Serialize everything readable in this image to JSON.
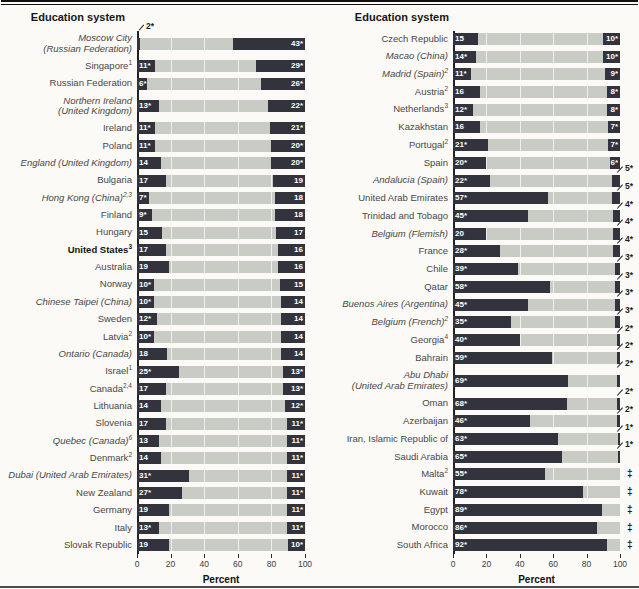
{
  "chart_data": {
    "type": "bar",
    "orientation": "horizontal",
    "header": "Education system",
    "xlabel": "Percent",
    "xlim": [
      0,
      100
    ],
    "xticks": [
      0,
      20,
      40,
      60,
      80,
      100
    ],
    "grid": "white vertical lines at 20/40/60/80 over bars",
    "legend_position": "none",
    "colors": {
      "segment_dark": "#32333c",
      "bar_background_gray": "#c8ccc5",
      "value_text": "#ffffff",
      "annotation_text": "#1c1c1c"
    },
    "panels": [
      {
        "rows": [
          {
            "lines": [
              "Moscow City",
              "(Russian Federation)"
            ],
            "italic": true,
            "left": {
              "v": 2,
              "t": "2*",
              "pos": "above"
            },
            "right": {
              "v": 43,
              "t": "43*",
              "pos": "in"
            }
          },
          {
            "lines": [
              "Singapore"
            ],
            "sup": "1",
            "left": {
              "v": 11,
              "t": "11*",
              "pos": "in"
            },
            "right": {
              "v": 29,
              "t": "29*",
              "pos": "in"
            }
          },
          {
            "lines": [
              "Russian Federation"
            ],
            "left": {
              "v": 6,
              "t": "6*",
              "pos": "in"
            },
            "right": {
              "v": 26,
              "t": "26*",
              "pos": "in"
            }
          },
          {
            "lines": [
              "Northern Ireland",
              "(United Kingdom)"
            ],
            "italic": true,
            "left": {
              "v": 13,
              "t": "13*",
              "pos": "in"
            },
            "right": {
              "v": 22,
              "t": "22*",
              "pos": "in"
            }
          },
          {
            "lines": [
              "Ireland"
            ],
            "left": {
              "v": 11,
              "t": "11*",
              "pos": "in"
            },
            "right": {
              "v": 21,
              "t": "21*",
              "pos": "in"
            }
          },
          {
            "lines": [
              "Poland"
            ],
            "left": {
              "v": 11,
              "t": "11*",
              "pos": "in"
            },
            "right": {
              "v": 20,
              "t": "20*",
              "pos": "in"
            }
          },
          {
            "lines": [
              "England (United Kingdom)"
            ],
            "italic": true,
            "left": {
              "v": 14,
              "t": "14",
              "pos": "in"
            },
            "right": {
              "v": 20,
              "t": "20*",
              "pos": "in"
            }
          },
          {
            "lines": [
              "Bulgaria"
            ],
            "left": {
              "v": 17,
              "t": "17",
              "pos": "in"
            },
            "right": {
              "v": 19,
              "t": "19",
              "pos": "in"
            }
          },
          {
            "lines": [
              "Hong Kong (China)"
            ],
            "sup": "2,3",
            "italic": true,
            "left": {
              "v": 7,
              "t": "7*",
              "pos": "in"
            },
            "right": {
              "v": 18,
              "t": "18",
              "pos": "in"
            }
          },
          {
            "lines": [
              "Finland"
            ],
            "left": {
              "v": 9,
              "t": "9*",
              "pos": "in"
            },
            "right": {
              "v": 18,
              "t": "18",
              "pos": "in"
            }
          },
          {
            "lines": [
              "Hungary"
            ],
            "left": {
              "v": 15,
              "t": "15",
              "pos": "in"
            },
            "right": {
              "v": 17,
              "t": "17",
              "pos": "in"
            }
          },
          {
            "lines": [
              "United States"
            ],
            "sup": "3",
            "bold": true,
            "left": {
              "v": 17,
              "t": "17",
              "pos": "in"
            },
            "right": {
              "v": 16,
              "t": "16",
              "pos": "in"
            }
          },
          {
            "lines": [
              "Australia"
            ],
            "left": {
              "v": 19,
              "t": "19",
              "pos": "in"
            },
            "right": {
              "v": 16,
              "t": "16",
              "pos": "in"
            }
          },
          {
            "lines": [
              "Norway"
            ],
            "left": {
              "v": 10,
              "t": "10*",
              "pos": "in"
            },
            "right": {
              "v": 15,
              "t": "15",
              "pos": "in"
            }
          },
          {
            "lines": [
              "Chinese Taipei (China)"
            ],
            "italic": true,
            "left": {
              "v": 10,
              "t": "10*",
              "pos": "in"
            },
            "right": {
              "v": 14,
              "t": "14",
              "pos": "in"
            }
          },
          {
            "lines": [
              "Sweden"
            ],
            "left": {
              "v": 12,
              "t": "12*",
              "pos": "in"
            },
            "right": {
              "v": 14,
              "t": "14",
              "pos": "in"
            }
          },
          {
            "lines": [
              "Latvia"
            ],
            "sup": "2",
            "left": {
              "v": 10,
              "t": "10*",
              "pos": "in"
            },
            "right": {
              "v": 14,
              "t": "14",
              "pos": "in"
            }
          },
          {
            "lines": [
              "Ontario (Canada)"
            ],
            "italic": true,
            "left": {
              "v": 18,
              "t": "18",
              "pos": "in"
            },
            "right": {
              "v": 14,
              "t": "14",
              "pos": "in"
            }
          },
          {
            "lines": [
              "Israel"
            ],
            "sup": "1",
            "left": {
              "v": 25,
              "t": "25*",
              "pos": "in"
            },
            "right": {
              "v": 13,
              "t": "13*",
              "pos": "in"
            }
          },
          {
            "lines": [
              "Canada"
            ],
            "sup": "2,4",
            "left": {
              "v": 17,
              "t": "17",
              "pos": "in"
            },
            "right": {
              "v": 13,
              "t": "13*",
              "pos": "in"
            }
          },
          {
            "lines": [
              "Lithuania"
            ],
            "left": {
              "v": 14,
              "t": "14",
              "pos": "in"
            },
            "right": {
              "v": 12,
              "t": "12*",
              "pos": "in"
            }
          },
          {
            "lines": [
              "Slovenia"
            ],
            "left": {
              "v": 17,
              "t": "17",
              "pos": "in"
            },
            "right": {
              "v": 11,
              "t": "11*",
              "pos": "in"
            }
          },
          {
            "lines": [
              "Quebec (Canada)"
            ],
            "sup": "6",
            "italic": true,
            "left": {
              "v": 13,
              "t": "13",
              "pos": "in"
            },
            "right": {
              "v": 11,
              "t": "11*",
              "pos": "in"
            }
          },
          {
            "lines": [
              "Denmark"
            ],
            "sup": "2",
            "left": {
              "v": 14,
              "t": "14",
              "pos": "in"
            },
            "right": {
              "v": 11,
              "t": "11*",
              "pos": "in"
            }
          },
          {
            "lines": [
              "Dubai (United Arab Emirates)"
            ],
            "italic": true,
            "left": {
              "v": 31,
              "t": "31*",
              "pos": "in"
            },
            "right": {
              "v": 11,
              "t": "11*",
              "pos": "in"
            }
          },
          {
            "lines": [
              "New Zealand"
            ],
            "left": {
              "v": 27,
              "t": "27*",
              "pos": "in"
            },
            "right": {
              "v": 11,
              "t": "11*",
              "pos": "in"
            }
          },
          {
            "lines": [
              "Germany"
            ],
            "left": {
              "v": 19,
              "t": "19",
              "pos": "in"
            },
            "right": {
              "v": 11,
              "t": "11*",
              "pos": "in"
            }
          },
          {
            "lines": [
              "Italy"
            ],
            "left": {
              "v": 13,
              "t": "13*",
              "pos": "in"
            },
            "right": {
              "v": 11,
              "t": "11*",
              "pos": "in"
            }
          },
          {
            "lines": [
              "Slovak Republic"
            ],
            "left": {
              "v": 19,
              "t": "19",
              "pos": "in"
            },
            "right": {
              "v": 10,
              "t": "10*",
              "pos": "in"
            }
          }
        ]
      },
      {
        "rows": [
          {
            "lines": [
              "Czech Republic"
            ],
            "left": {
              "v": 15,
              "t": "15",
              "pos": "in"
            },
            "right": {
              "v": 10,
              "t": "10*",
              "pos": "in"
            }
          },
          {
            "lines": [
              "Macao (China)"
            ],
            "italic": true,
            "left": {
              "v": 14,
              "t": "14*",
              "pos": "in"
            },
            "right": {
              "v": 10,
              "t": "10*",
              "pos": "in"
            }
          },
          {
            "lines": [
              "Madrid (Spain)"
            ],
            "sup": "2",
            "italic": true,
            "left": {
              "v": 11,
              "t": "11*",
              "pos": "in"
            },
            "right": {
              "v": 9,
              "t": "9*",
              "pos": "in"
            }
          },
          {
            "lines": [
              "Austria"
            ],
            "sup": "2",
            "left": {
              "v": 16,
              "t": "16",
              "pos": "in"
            },
            "right": {
              "v": 8,
              "t": "8*",
              "pos": "in"
            }
          },
          {
            "lines": [
              "Netherlands"
            ],
            "sup": "3",
            "left": {
              "v": 12,
              "t": "12*",
              "pos": "in"
            },
            "right": {
              "v": 8,
              "t": "8*",
              "pos": "in"
            }
          },
          {
            "lines": [
              "Kazakhstan"
            ],
            "left": {
              "v": 16,
              "t": "16",
              "pos": "in"
            },
            "right": {
              "v": 7,
              "t": "7*",
              "pos": "in"
            }
          },
          {
            "lines": [
              "Portugal"
            ],
            "sup": "2",
            "left": {
              "v": 21,
              "t": "21*",
              "pos": "in"
            },
            "right": {
              "v": 7,
              "t": "7*",
              "pos": "in"
            }
          },
          {
            "lines": [
              "Spain"
            ],
            "left": {
              "v": 20,
              "t": "20*",
              "pos": "in"
            },
            "right": {
              "v": 6,
              "t": "6*",
              "pos": "in"
            }
          },
          {
            "lines": [
              "Andalucia (Spain)"
            ],
            "italic": true,
            "left": {
              "v": 22,
              "t": "22*",
              "pos": "in"
            },
            "right": {
              "v": 5,
              "t": "5*",
              "pos": "out"
            }
          },
          {
            "lines": [
              "United Arab Emirates"
            ],
            "left": {
              "v": 57,
              "t": "57*",
              "pos": "in"
            },
            "right": {
              "v": 5,
              "t": "5*",
              "pos": "out"
            }
          },
          {
            "lines": [
              "Trinidad and Tobago"
            ],
            "left": {
              "v": 45,
              "t": "45*",
              "pos": "in"
            },
            "right": {
              "v": 4,
              "t": "4*",
              "pos": "out"
            }
          },
          {
            "lines": [
              "Belgium (Flemish)"
            ],
            "italic": true,
            "left": {
              "v": 20,
              "t": "20",
              "pos": "in"
            },
            "right": {
              "v": 4,
              "t": "4*",
              "pos": "out"
            }
          },
          {
            "lines": [
              "France"
            ],
            "left": {
              "v": 28,
              "t": "28*",
              "pos": "in"
            },
            "right": {
              "v": 4,
              "t": "4*",
              "pos": "out"
            }
          },
          {
            "lines": [
              "Chile"
            ],
            "left": {
              "v": 39,
              "t": "39*",
              "pos": "in"
            },
            "right": {
              "v": 3,
              "t": "3*",
              "pos": "out"
            }
          },
          {
            "lines": [
              "Qatar"
            ],
            "left": {
              "v": 58,
              "t": "58*",
              "pos": "in"
            },
            "right": {
              "v": 3,
              "t": "3*",
              "pos": "out"
            }
          },
          {
            "lines": [
              "Buenos Aires (Argentina)"
            ],
            "italic": true,
            "left": {
              "v": 45,
              "t": "45*",
              "pos": "in"
            },
            "right": {
              "v": 3,
              "t": "3*",
              "pos": "out"
            }
          },
          {
            "lines": [
              "Belgium (French)"
            ],
            "sup": "2",
            "italic": true,
            "left": {
              "v": 35,
              "t": "35*",
              "pos": "in"
            },
            "right": {
              "v": 3,
              "t": "3*",
              "pos": "out"
            }
          },
          {
            "lines": [
              "Georgia"
            ],
            "sup": "4",
            "left": {
              "v": 40,
              "t": "40*",
              "pos": "in"
            },
            "right": {
              "v": 2,
              "t": "2*",
              "pos": "out"
            }
          },
          {
            "lines": [
              "Bahrain"
            ],
            "left": {
              "v": 59,
              "t": "59*",
              "pos": "in"
            },
            "right": {
              "v": 2,
              "t": "2*",
              "pos": "out"
            }
          },
          {
            "lines": [
              "Abu Dhabi",
              "(United Arab Emirates)"
            ],
            "italic": true,
            "left": {
              "v": 69,
              "t": "69*",
              "pos": "in"
            },
            "right": {
              "v": 2,
              "t": "2*",
              "pos": "out"
            }
          },
          {
            "lines": [
              "Oman"
            ],
            "left": {
              "v": 68,
              "t": "68*",
              "pos": "in"
            },
            "right": {
              "v": 2,
              "t": "2*",
              "pos": "out"
            }
          },
          {
            "lines": [
              "Azerbaijan"
            ],
            "left": {
              "v": 46,
              "t": "46*",
              "pos": "in"
            },
            "right": {
              "v": 2,
              "t": "2*",
              "pos": "out"
            }
          },
          {
            "lines": [
              "Iran, Islamic Republic of"
            ],
            "left": {
              "v": 63,
              "t": "63*",
              "pos": "in"
            },
            "right": {
              "v": 1,
              "t": "1*",
              "pos": "out"
            }
          },
          {
            "lines": [
              "Saudi Arabia"
            ],
            "left": {
              "v": 65,
              "t": "65*",
              "pos": "in"
            },
            "right": {
              "v": 1,
              "t": "1*",
              "pos": "out"
            }
          },
          {
            "lines": [
              "Malta"
            ],
            "sup": "2",
            "left": {
              "v": 55,
              "t": "55*",
              "pos": "in"
            },
            "right": {
              "v": 0,
              "t": "‡",
              "pos": "dagger"
            }
          },
          {
            "lines": [
              "Kuwait"
            ],
            "left": {
              "v": 78,
              "t": "78*",
              "pos": "in"
            },
            "right": {
              "v": 0,
              "t": "‡",
              "pos": "dagger"
            }
          },
          {
            "lines": [
              "Egypt"
            ],
            "left": {
              "v": 89,
              "t": "89*",
              "pos": "in"
            },
            "right": {
              "v": 0,
              "t": "‡",
              "pos": "dagger"
            }
          },
          {
            "lines": [
              "Morocco"
            ],
            "left": {
              "v": 86,
              "t": "86*",
              "pos": "in"
            },
            "right": {
              "v": 0,
              "t": "‡",
              "pos": "dagger"
            }
          },
          {
            "lines": [
              "South Africa"
            ],
            "left": {
              "v": 92,
              "t": "92*",
              "pos": "in"
            },
            "right": {
              "v": 0,
              "t": "‡",
              "pos": "dagger"
            }
          }
        ]
      }
    ]
  }
}
